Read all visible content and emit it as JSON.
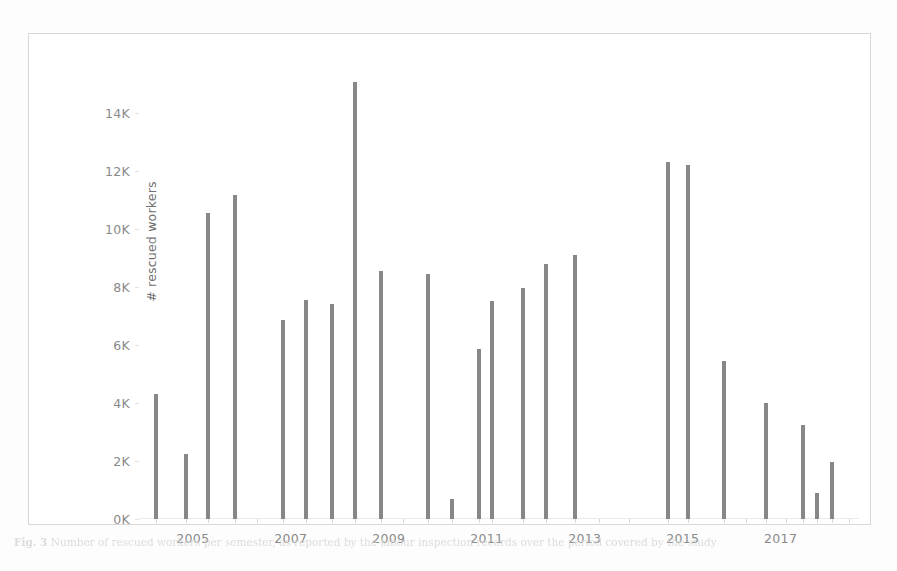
{
  "figure": {
    "caption_label": "Fig. 3",
    "caption_text": "Number of rescued workers per semester, as reported by the labour inspection records over the period covered by the study"
  },
  "chart_data": {
    "type": "bar",
    "title": "",
    "xlabel": "",
    "ylabel": "# rescued workers",
    "ylim": [
      0,
      15500
    ],
    "yticks": [
      0,
      2000,
      4000,
      6000,
      8000,
      10000,
      12000,
      14000
    ],
    "ytick_labels": [
      "0K",
      "2K",
      "4K",
      "6K",
      "8K",
      "10K",
      "12K",
      "14K"
    ],
    "xlim": [
      2003.9,
      2018.6
    ],
    "xtick_labels": [
      "2005",
      "2007",
      "2009",
      "2011",
      "2013",
      "2015",
      "2017"
    ],
    "xticks": [
      2005,
      2007,
      2009,
      2011,
      2013,
      2015,
      2017
    ],
    "grid": false,
    "legend": "none",
    "bar_color": "#878787",
    "x": [
      2004.25,
      2004.85,
      2005.3,
      2005.85,
      2006.85,
      2007.3,
      2007.85,
      2008.3,
      2008.85,
      2009.8,
      2010.3,
      2010.85,
      2011.1,
      2011.75,
      2012.2,
      2012.8,
      2014.7,
      2015.1,
      2015.85,
      2016.7,
      2017.45,
      2017.75,
      2018.05
    ],
    "values": [
      4300,
      2250,
      10550,
      11150,
      6850,
      7550,
      7400,
      15050,
      8550,
      8450,
      700,
      5850,
      7500,
      7950,
      8800,
      9100,
      12300,
      12200,
      5450,
      4000,
      3250,
      900,
      1950
    ],
    "categories": [
      "2004 H1",
      "2004 H2",
      "2005 H1",
      "2005 H2",
      "2006 H2",
      "2007 H1",
      "2007 H2",
      "2008 H1",
      "2008 H2",
      "2009 H2",
      "2010 H1",
      "2010 H2",
      "2011 H1",
      "2011 H2",
      "2012 H1",
      "2012 H2",
      "2014 H2",
      "2015 H1",
      "2015 H2",
      "2016 H2",
      "2017 H1",
      "2017 H2",
      "2018 H1"
    ],
    "minor_ticks_x": [
      2004.25,
      2004.85,
      2005.3,
      2005.85,
      2006.3,
      2006.85,
      2007.3,
      2007.85,
      2008.3,
      2008.85,
      2009.3,
      2009.8,
      2010.3,
      2010.85,
      2011.1,
      2011.75,
      2012.2,
      2012.8,
      2013.3,
      2013.9,
      2014.7,
      2015.1,
      2015.85,
      2016.3,
      2016.7,
      2017.1,
      2017.45,
      2017.75,
      2018.05,
      2018.4
    ]
  }
}
